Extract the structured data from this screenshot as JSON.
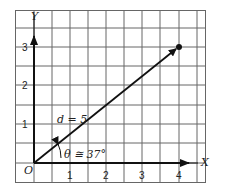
{
  "diagram": {
    "axes": {
      "x_label": "X",
      "y_label": "Y",
      "origin_label": "O"
    },
    "x_ticks": [
      "1",
      "2",
      "3",
      "4"
    ],
    "y_ticks": [
      "1",
      "2",
      "3"
    ],
    "vector": {
      "magnitude_label": "d = 5",
      "angle_label": "θ ≅ 37°",
      "end_point": [
        4,
        3
      ]
    },
    "colors": {
      "grid": "#555555",
      "axis": "#111111",
      "background": "#ffffff"
    }
  }
}
